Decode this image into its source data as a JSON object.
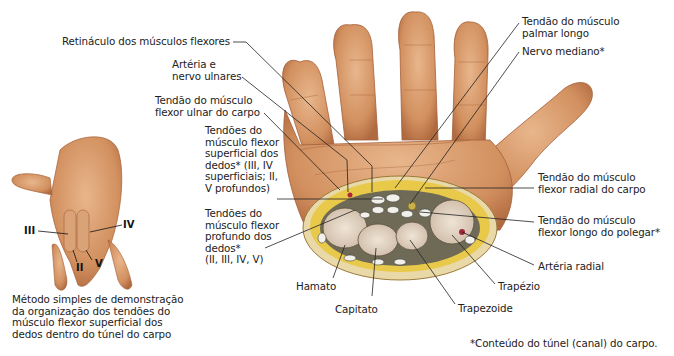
{
  "figure": {
    "footnote": "*Conteúdo do túnel (canal) do carpo."
  },
  "labels_left": {
    "retinaculo": "Retináculo dos músculos flexores",
    "arteria_nervo_ulnares": "Artéria e\nnervo ulnares",
    "flexor_ulnar": "Tendão do músculo\nflexor ulnar do carpo",
    "flexor_superficial": "Tendões do\nmúsculo flexor\nsuperficial dos\ndedos* (III, IV\nsuperficiais; II,\nV profundos)",
    "flexor_profundo": "Tendões do\nmúsculo flexor\nprofundo dos\ndedos*\n(II, III, IV, V)"
  },
  "labels_right": {
    "palmar_longo": "Tendão do músculo\npalmar longo",
    "nervo_mediano": "Nervo mediano*",
    "flexor_radial": "Tendão do músculo\nflexor radial do carpo",
    "flexor_longo_polegar": "Tendão do músculo\nflexor longo do polegar*",
    "arteria_radial": "Artéria radial",
    "trapezio": "Trapézio"
  },
  "labels_bottom": {
    "hamato": "Hamato",
    "capitato": "Capitato",
    "trapezoide": "Trapezoide"
  },
  "inset": {
    "caption": "Método simples de demonstração\nda organização dos tendões do\nmúsculo flexor superficial dos\ndedos dentro do túnel do carpo",
    "fingers": {
      "III": "III",
      "IV": "IV",
      "II": "II",
      "V": "V"
    }
  },
  "colors": {
    "skin": "#d99a6c",
    "skin_dark": "#b86f45",
    "fat": "#e8c94a",
    "bone": "#e9dccb",
    "leader": "#222222"
  }
}
